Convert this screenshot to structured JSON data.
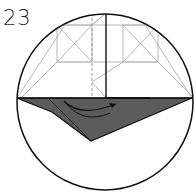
{
  "diagram": {
    "step_number": "23",
    "type": "origami-fold-step",
    "colors": {
      "outline": "#111111",
      "guide_lines": "#b5b5b5",
      "paper_back": "#5a5a5a",
      "paper_front": "#ffffff"
    },
    "elements": [
      "circular-detail-view",
      "gray-crease-pattern",
      "dashed-valley-fold-line",
      "solid-center-edge",
      "dark-flap",
      "curved-fold-arrow"
    ]
  }
}
